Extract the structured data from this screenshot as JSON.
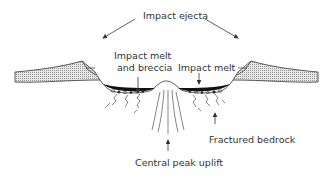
{
  "diagram": {
    "labels": {
      "impact_ejecta": "Impact ejecta",
      "impact_melt_breccia_line1": "Impact melt",
      "impact_melt_breccia_line2": "and breccia",
      "impact_melt": "Impact melt",
      "fractured_bedrock": "Fractured bedrock",
      "central_peak_uplift": "Central peak uplift"
    },
    "colors": {
      "line": "#333333",
      "ejecta_fill": "#dcdcdc",
      "melt_fill": "#111111",
      "background": "#ffffff"
    }
  }
}
